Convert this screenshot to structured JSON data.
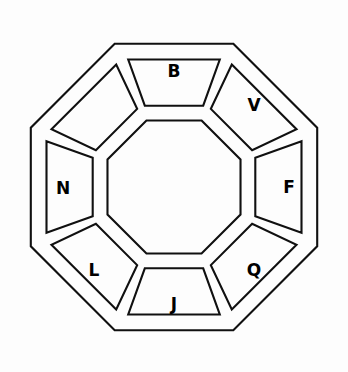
{
  "figure": {
    "background_color": "#fdfdfd",
    "line_color": "#101010",
    "letter_color": "#000000",
    "shape": "octagon-ring",
    "segment_count": 8,
    "width": 348,
    "height": 372
  },
  "geometry": {
    "center_x": 174,
    "center_y": 187,
    "outer_radius": 155,
    "outer_inset_radius": 138,
    "inner_radius": 72,
    "inner_outset_radius": 88,
    "segment_gap_degrees": 5.5,
    "rotation_degrees": 22.5
  },
  "segments": [
    {
      "id": "segment-top",
      "position": "top",
      "letter": "B",
      "label_x": 174,
      "label_y": 71,
      "empty": false
    },
    {
      "id": "segment-top-right",
      "position": "top-right",
      "letter": "V",
      "label_x": 254,
      "label_y": 105,
      "empty": false
    },
    {
      "id": "segment-right",
      "position": "right",
      "letter": "F",
      "label_x": 289,
      "label_y": 187,
      "empty": false
    },
    {
      "id": "segment-bottom-right",
      "position": "bottom-right",
      "letter": "Q",
      "label_x": 254,
      "label_y": 270,
      "empty": false
    },
    {
      "id": "segment-bottom",
      "position": "bottom",
      "letter": "J",
      "label_x": 174,
      "label_y": 304,
      "empty": false
    },
    {
      "id": "segment-bottom-left",
      "position": "bottom-left",
      "letter": "L",
      "label_x": 94,
      "label_y": 270,
      "empty": false
    },
    {
      "id": "segment-left",
      "position": "left",
      "letter": "N",
      "label_x": 63,
      "label_y": 188,
      "empty": false
    },
    {
      "id": "segment-top-left",
      "position": "top-left",
      "letter": "",
      "label_x": 94,
      "label_y": 105,
      "empty": true
    }
  ]
}
